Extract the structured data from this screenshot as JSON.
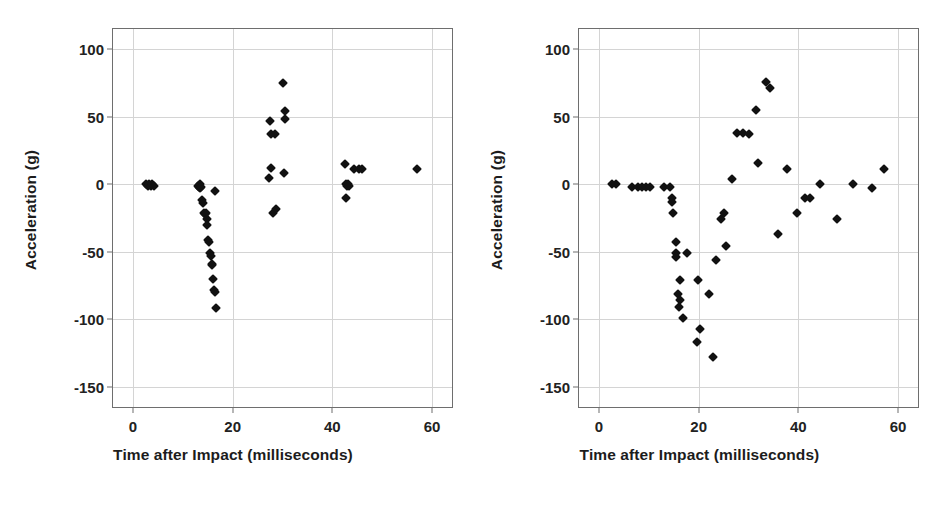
{
  "figure": {
    "background": "#ffffff",
    "marker_color": "#111111",
    "grid_color": "#d4d4d4",
    "axis_color": "#6e6e6e"
  },
  "panels": [
    {
      "id": "left-panel",
      "xlabel": "Time after Impact (milliseconds)",
      "ylabel": "Acceleration (g)"
    },
    {
      "id": "right-panel",
      "xlabel": "Time after Impact (milliseconds)",
      "ylabel": "Acceleration (g)"
    }
  ],
  "chart_data": [
    {
      "type": "scatter",
      "title": "",
      "xlabel": "Time after Impact (milliseconds)",
      "ylabel": "Acceleration (g)",
      "xlim": [
        -4,
        64
      ],
      "ylim": [
        -165,
        115
      ],
      "xticks": [
        0,
        20,
        40,
        60
      ],
      "yticks": [
        100,
        50,
        0,
        -50,
        -100,
        -150
      ],
      "xtick_labels": [
        "0",
        "20",
        "40",
        "60"
      ],
      "ytick_labels": [
        "100",
        "50",
        "0",
        "-50",
        "-100",
        "-150"
      ],
      "grid": true,
      "legend": "none",
      "points": [
        [
          2.6,
          0
        ],
        [
          3.0,
          -1
        ],
        [
          3.3,
          0
        ],
        [
          3.6,
          -1
        ],
        [
          3.9,
          0
        ],
        [
          4.3,
          -1
        ],
        [
          13.0,
          -1
        ],
        [
          13.2,
          -2
        ],
        [
          13.4,
          0
        ],
        [
          13.5,
          -3
        ],
        [
          13.7,
          -2
        ],
        [
          13.9,
          -12
        ],
        [
          14.0,
          -14
        ],
        [
          14.2,
          -21
        ],
        [
          14.4,
          -22
        ],
        [
          14.6,
          -21
        ],
        [
          14.8,
          -26
        ],
        [
          14.9,
          -30
        ],
        [
          15.1,
          -41
        ],
        [
          15.3,
          -43
        ],
        [
          15.4,
          -51
        ],
        [
          15.6,
          -53
        ],
        [
          15.8,
          -59
        ],
        [
          15.9,
          -60
        ],
        [
          16.1,
          -70
        ],
        [
          16.3,
          -78
        ],
        [
          16.4,
          -80
        ],
        [
          16.7,
          -92
        ],
        [
          16.4,
          -5
        ],
        [
          27.3,
          5
        ],
        [
          27.6,
          12
        ],
        [
          27.5,
          47
        ],
        [
          27.6,
          37
        ],
        [
          28.5,
          37
        ],
        [
          28.0,
          -21
        ],
        [
          28.6,
          -18
        ],
        [
          30.0,
          75
        ],
        [
          30.5,
          54
        ],
        [
          30.6,
          48
        ],
        [
          30.4,
          8
        ],
        [
          42.6,
          15
        ],
        [
          42.7,
          0
        ],
        [
          43.0,
          -1
        ],
        [
          43.1,
          0
        ],
        [
          43.4,
          -1
        ],
        [
          42.8,
          -10
        ],
        [
          44.3,
          11
        ],
        [
          45.3,
          11
        ],
        [
          46.0,
          11
        ],
        [
          57.0,
          11
        ]
      ]
    },
    {
      "type": "scatter",
      "title": "",
      "xlabel": "Time after Impact (milliseconds)",
      "ylabel": "Acceleration (g)",
      "xlim": [
        -4,
        64
      ],
      "ylim": [
        -165,
        115
      ],
      "xticks": [
        0,
        20,
        40,
        60
      ],
      "yticks": [
        100,
        50,
        0,
        -50,
        -100,
        -150
      ],
      "xtick_labels": [
        "0",
        "20",
        "40",
        "60"
      ],
      "ytick_labels": [
        "100",
        "50",
        "0",
        "-50",
        "-100",
        "-150"
      ],
      "grid": true,
      "legend": "none",
      "points": [
        [
          2.6,
          0
        ],
        [
          3.4,
          0
        ],
        [
          6.7,
          -2
        ],
        [
          7.8,
          -2
        ],
        [
          8.6,
          -2
        ],
        [
          9.4,
          -2
        ],
        [
          10.2,
          -2
        ],
        [
          13.1,
          -2
        ],
        [
          14.2,
          -2
        ],
        [
          14.6,
          -10
        ],
        [
          14.6,
          -13
        ],
        [
          14.9,
          -21
        ],
        [
          15.5,
          -43
        ],
        [
          15.4,
          -51
        ],
        [
          15.5,
          -54
        ],
        [
          16.2,
          -71
        ],
        [
          15.8,
          -81
        ],
        [
          16.3,
          -86
        ],
        [
          16.0,
          -91
        ],
        [
          16.8,
          -99
        ],
        [
          17.7,
          -51
        ],
        [
          19.9,
          -71
        ],
        [
          20.3,
          -107
        ],
        [
          19.7,
          -117
        ],
        [
          22.0,
          -81
        ],
        [
          22.8,
          -128
        ],
        [
          23.5,
          -56
        ],
        [
          24.5,
          -26
        ],
        [
          25.1,
          -21
        ],
        [
          25.4,
          -46
        ],
        [
          26.6,
          4
        ],
        [
          27.6,
          38
        ],
        [
          28.9,
          38
        ],
        [
          30.0,
          37
        ],
        [
          31.6,
          55
        ],
        [
          33.5,
          76
        ],
        [
          34.3,
          71
        ],
        [
          32.0,
          16
        ],
        [
          36.0,
          -37
        ],
        [
          37.7,
          11
        ],
        [
          39.8,
          -21
        ],
        [
          41.4,
          -10
        ],
        [
          42.3,
          -10
        ],
        [
          44.3,
          0
        ],
        [
          47.8,
          -26
        ],
        [
          50.9,
          0
        ],
        [
          54.7,
          -3
        ],
        [
          57.1,
          11
        ]
      ]
    }
  ]
}
